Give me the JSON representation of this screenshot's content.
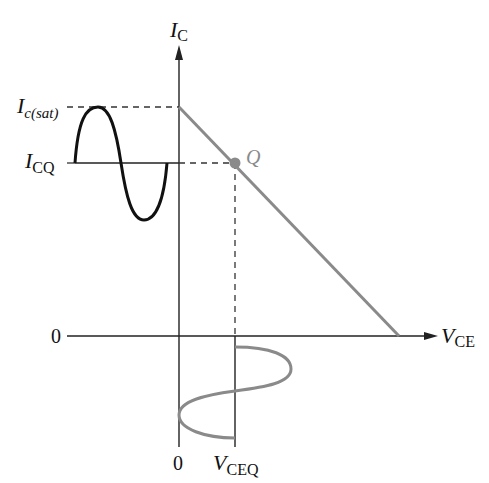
{
  "diagram": {
    "y_axis": {
      "label_main": "I",
      "label_sub": "C"
    },
    "x_axis": {
      "label_main": "V",
      "label_sub": "CE"
    },
    "y_marks": [
      {
        "main": "I",
        "sub": "c(sat)"
      },
      {
        "main": "I",
        "sub": "CQ"
      },
      {
        "text": "0"
      }
    ],
    "x_marks": [
      {
        "text": "0"
      },
      {
        "main": "V",
        "sub": "CEQ"
      }
    ],
    "q_point_label": "Q",
    "colors": {
      "axes": "#222222",
      "load_line": "#8a8a8a",
      "input_signal": "#111111",
      "output_signal": "#8a8a8a",
      "q_point": "#8a8a8a"
    }
  }
}
